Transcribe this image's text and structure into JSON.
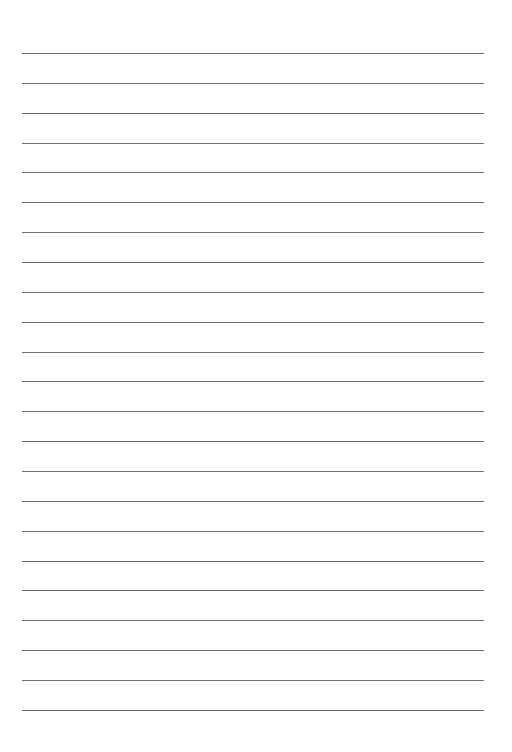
{
  "page": {
    "type": "lined-paper",
    "background": "#ffffff",
    "line_color": "#6e6e6e",
    "line_count": 23,
    "first_line_y": 53,
    "line_spacing": 29.86,
    "line_left": 22,
    "line_right": 484
  }
}
